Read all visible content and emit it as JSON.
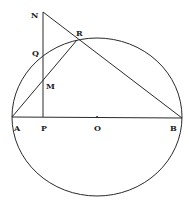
{
  "diagram": {
    "type": "geometry",
    "colors": {
      "stroke": "#2a2a2a",
      "label": "#222222",
      "background": "#ffffff"
    },
    "circle": {
      "center_label": "O",
      "cx": 97,
      "cy": 117,
      "rx": 85,
      "ry": 79
    },
    "points": [
      {
        "label": "N",
        "x": 43,
        "y": 12,
        "lx": 31,
        "ly": 18
      },
      {
        "label": "R",
        "x": 77,
        "y": 40,
        "lx": 76,
        "ly": 36
      },
      {
        "label": "Q",
        "x": 43,
        "y": 55,
        "lx": 32,
        "ly": 55
      },
      {
        "label": "M",
        "x": 43,
        "y": 80,
        "lx": 46,
        "ly": 89
      },
      {
        "label": "A",
        "x": 12,
        "y": 117,
        "lx": 14,
        "ly": 130
      },
      {
        "label": "P",
        "x": 43,
        "y": 117,
        "lx": 41,
        "ly": 130
      },
      {
        "label": "O",
        "x": 97,
        "y": 117,
        "lx": 94,
        "ly": 130
      },
      {
        "label": "B",
        "x": 182,
        "y": 118,
        "lx": 170,
        "ly": 130
      }
    ],
    "segments": [
      {
        "from": "A",
        "to": "B"
      },
      {
        "from": "N",
        "to": "P"
      },
      {
        "from": "N",
        "to": "B"
      },
      {
        "from": "A",
        "to": "R"
      }
    ]
  }
}
